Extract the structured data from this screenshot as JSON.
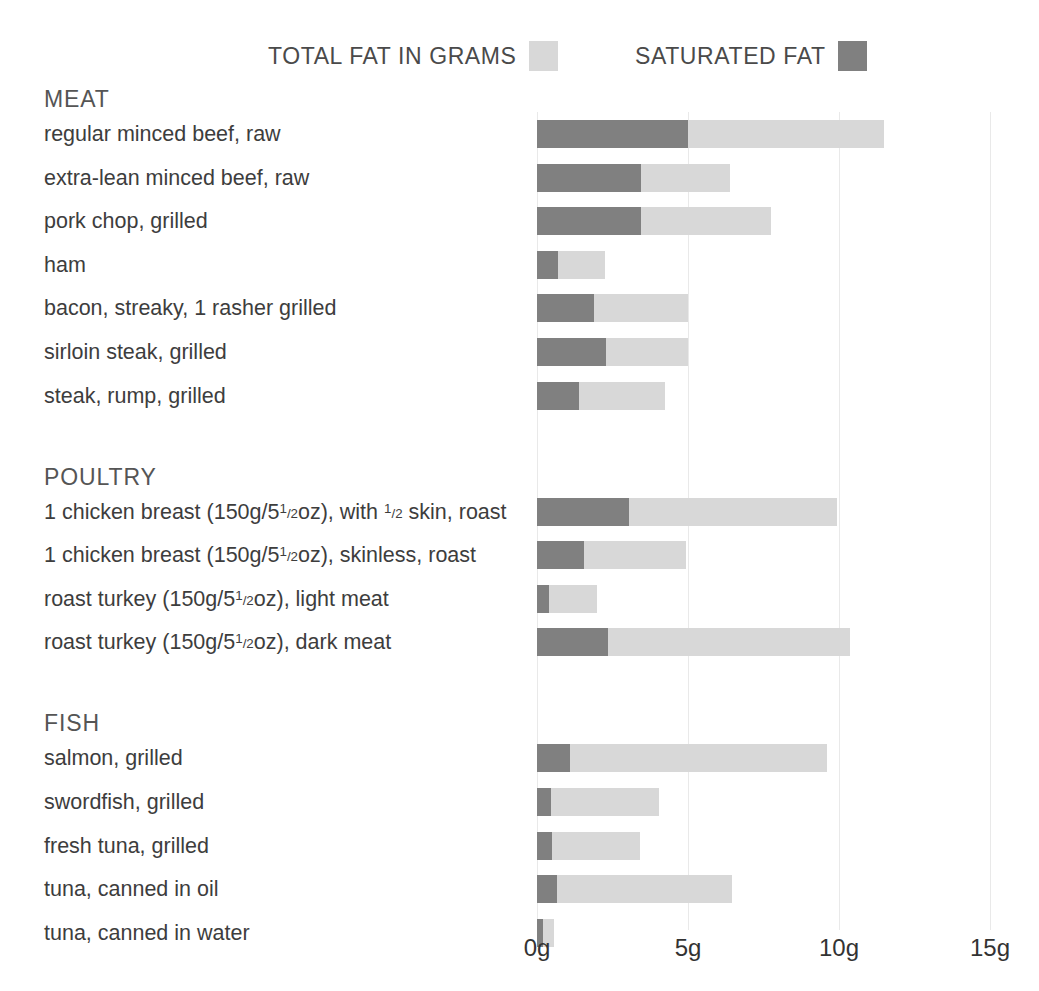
{
  "legend": {
    "total_label": "TOTAL FAT IN GRAMS",
    "saturated_label": "SATURATED FAT",
    "total_color": "#d8d8d8",
    "saturated_color": "#808080"
  },
  "axis": {
    "ticks": [
      "0g",
      "5g",
      "10g",
      "15g"
    ],
    "tick_values": [
      0,
      5,
      10,
      15
    ]
  },
  "chart_data": {
    "type": "bar",
    "orientation": "horizontal",
    "stacked": true,
    "title": "",
    "xlabel": "",
    "ylabel": "",
    "xlim": [
      0,
      15
    ],
    "grid": true,
    "legend_position": "top",
    "series": [
      {
        "name": "SATURATED FAT",
        "color": "#808080"
      },
      {
        "name": "TOTAL FAT IN GRAMS",
        "color": "#d8d8d8"
      }
    ],
    "units": "g",
    "sections": [
      {
        "name": "MEAT",
        "items": [
          {
            "label": "regular minced beef, raw",
            "saturated": 5.0,
            "total": 11.5
          },
          {
            "label": "extra-lean minced beef, raw",
            "saturated": 3.45,
            "total": 6.4
          },
          {
            "label": "pork chop, grilled",
            "saturated": 3.45,
            "total": 7.75
          },
          {
            "label": "ham",
            "saturated": 0.7,
            "total": 2.25
          },
          {
            "label": "bacon, streaky, 1 rasher grilled",
            "saturated": 1.9,
            "total": 5.0
          },
          {
            "label": "sirloin steak, grilled",
            "saturated": 2.3,
            "total": 5.0
          },
          {
            "label": "steak, rump, grilled",
            "saturated": 1.4,
            "total": 4.25
          }
        ]
      },
      {
        "name": "POULTRY",
        "items": [
          {
            "label": "1 chicken breast (150g/5½oz), with ½ skin, roast",
            "saturated": 3.05,
            "total": 9.95
          },
          {
            "label": "1 chicken breast (150g/5½oz), skinless, roast",
            "saturated": 1.55,
            "total": 4.95
          },
          {
            "label": "roast turkey (150g/5½oz), light meat",
            "saturated": 0.4,
            "total": 2.0
          },
          {
            "label": "roast turkey (150g/5½oz), dark meat",
            "saturated": 2.35,
            "total": 10.35
          }
        ]
      },
      {
        "name": "FISH",
        "items": [
          {
            "label": "salmon, grilled",
            "saturated": 1.1,
            "total": 9.6
          },
          {
            "label": "swordfish, grilled",
            "saturated": 0.45,
            "total": 4.05
          },
          {
            "label": "fresh tuna, grilled",
            "saturated": 0.5,
            "total": 3.4
          },
          {
            "label": "tuna, canned in oil",
            "saturated": 0.65,
            "total": 6.45
          },
          {
            "label": "tuna, canned in water",
            "saturated": 0.2,
            "total": 0.55
          }
        ]
      }
    ]
  },
  "label_markup": {
    "chicken_skin": "1 chicken breast (150g/5<sup>1</sup><sub>/2</sub>oz), with <sup>1</sup><sub>/2</sub> skin, roast",
    "chicken_skinless": "1 chicken breast (150g/5<sup>1</sup><sub>/2</sub>oz), skinless, roast",
    "turkey_light": "roast turkey (150g/5<sup>1</sup><sub>/2</sub>oz), light meat",
    "turkey_dark": "roast turkey (150g/5<sup>1</sup><sub>/2</sub>oz), dark meat"
  }
}
